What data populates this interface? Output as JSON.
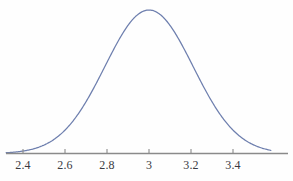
{
  "figure": {
    "background_color": "#fefefe",
    "curve_color": "#6e7fae",
    "axis_color": "#8a8a8a",
    "tick_color": "#8a8a8a",
    "label_color": "#3a3a42"
  },
  "chart_data": {
    "type": "line",
    "title": "",
    "subtitle": "",
    "xlabel": "",
    "ylabel": "",
    "grid": false,
    "legend": false,
    "legend_position": "none",
    "distribution": "normal",
    "mean": 3,
    "std_dev": 0.21,
    "xlim": [
      2.32,
      3.58
    ],
    "ylim": [
      0,
      1.05
    ],
    "x_ticks": [
      2.4,
      2.6,
      2.8,
      3,
      3.2,
      3.4
    ],
    "x_tick_labels": [
      "2.4",
      "2.6",
      "2.8",
      "3",
      "3.2",
      "3.4"
    ],
    "y_ticks": [],
    "y_tick_labels": [],
    "x": [
      2.32,
      2.36,
      2.4,
      2.44,
      2.48,
      2.52,
      2.56,
      2.6,
      2.64,
      2.68,
      2.72,
      2.76,
      2.8,
      2.84,
      2.88,
      2.92,
      2.96,
      3.0,
      3.04,
      3.08,
      3.12,
      3.16,
      3.2,
      3.24,
      3.28,
      3.32,
      3.36,
      3.4,
      3.44,
      3.48,
      3.52,
      3.58
    ],
    "y": [
      0.005,
      0.011,
      0.021,
      0.039,
      0.067,
      0.109,
      0.168,
      0.245,
      0.339,
      0.445,
      0.556,
      0.663,
      0.759,
      0.853,
      0.925,
      0.972,
      0.997,
      1.0,
      0.997,
      0.972,
      0.925,
      0.853,
      0.759,
      0.663,
      0.556,
      0.445,
      0.339,
      0.245,
      0.168,
      0.109,
      0.067,
      0.021
    ],
    "series": [
      {
        "name": "normal density",
        "values": [
          0.005,
          0.011,
          0.021,
          0.039,
          0.067,
          0.109,
          0.168,
          0.245,
          0.339,
          0.445,
          0.556,
          0.663,
          0.759,
          0.853,
          0.925,
          0.972,
          0.997,
          1.0,
          0.997,
          0.972,
          0.925,
          0.853,
          0.759,
          0.663,
          0.556,
          0.445,
          0.339,
          0.245,
          0.168,
          0.109,
          0.067,
          0.021
        ]
      }
    ],
    "annotations": []
  },
  "axis": {
    "ticks": [
      {
        "label": "2.4",
        "value": 2.4
      },
      {
        "label": "2.6",
        "value": 2.6
      },
      {
        "label": "2.8",
        "value": 2.8
      },
      {
        "label": "3",
        "value": 3
      },
      {
        "label": "3.2",
        "value": 3.2
      },
      {
        "label": "3.4",
        "value": 3.4
      }
    ]
  }
}
